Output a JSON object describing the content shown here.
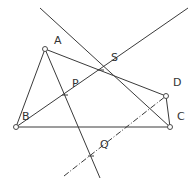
{
  "diagram": {
    "type": "geometry",
    "points": {
      "A": {
        "label": "A",
        "x": 45,
        "y": 49,
        "lx": 54,
        "ly": 44
      },
      "B": {
        "label": "B",
        "x": 16,
        "y": 127,
        "lx": 22,
        "ly": 120
      },
      "C": {
        "label": "C",
        "x": 170,
        "y": 127,
        "lx": 177,
        "ly": 120
      },
      "D": {
        "label": "D",
        "x": 166,
        "y": 96,
        "lx": 173,
        "ly": 86
      },
      "P": {
        "label": "P",
        "x": 65,
        "y": 95,
        "lx": 72,
        "ly": 87
      },
      "S": {
        "label": "S",
        "x": 101,
        "y": 70,
        "lx": 111,
        "ly": 61
      },
      "Q": {
        "label": "Q",
        "x": 91,
        "y": 156,
        "lx": 100,
        "ly": 148
      }
    },
    "labels": [
      "A",
      "B",
      "C",
      "D",
      "P",
      "S",
      "Q"
    ],
    "segments": [
      "AB",
      "BC",
      "AD",
      "DC",
      "BS-extended",
      "AQ-extended",
      "diagonal-through-S-to-C",
      "dashed-Q-to-D"
    ],
    "stroke_color": "#3a3a3a",
    "background": "#ffffff"
  }
}
